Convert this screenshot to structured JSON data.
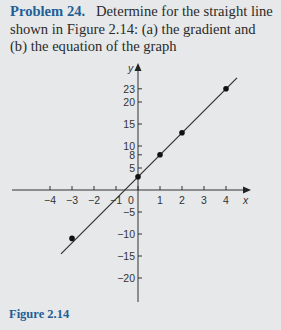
{
  "problem": {
    "label": "Problem 24.",
    "text": "Determine for the straight line shown in Figure 2.14: (a) the gradient and (b) the equation of the graph"
  },
  "figure": {
    "caption": "Figure 2.14"
  },
  "colors": {
    "background": "#e6e8ea",
    "accent": "#1f5f96",
    "line": "#333333"
  },
  "chart_data": {
    "type": "line",
    "title": "",
    "xlabel": "x",
    "ylabel": "y",
    "xlim": [
      -4.5,
      5.2
    ],
    "ylim": [
      -23,
      27
    ],
    "x_ticks": [
      -4,
      -3,
      -2,
      -1,
      0,
      1,
      2,
      3,
      4
    ],
    "y_ticks": [
      -20,
      -15,
      -10,
      -5,
      5,
      8,
      10,
      15,
      20,
      23
    ],
    "grid": false,
    "legend": null,
    "series": [
      {
        "name": "straight line",
        "x": [
          -3,
          0,
          1,
          2,
          4
        ],
        "y": [
          -11,
          3,
          8,
          13,
          23
        ],
        "line_extent_x": [
          -3.5,
          4.5
        ]
      }
    ]
  }
}
